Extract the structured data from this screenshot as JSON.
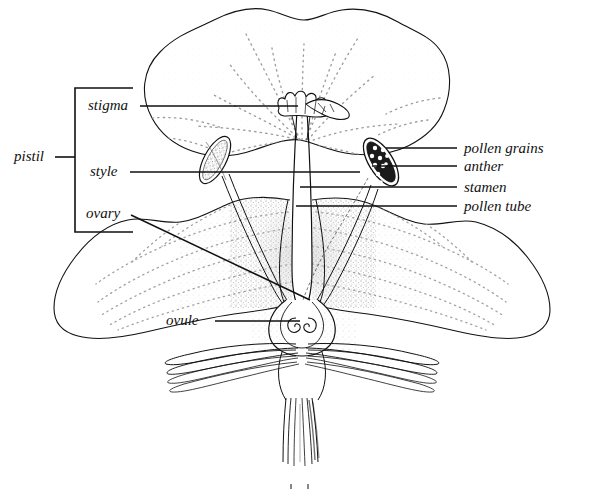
{
  "diagram": {
    "background_color": "#ffffff",
    "ink_color": "#111111",
    "stipple_color": "#9a9a9a",
    "width": 608,
    "height": 493
  },
  "group_labels": {
    "pistil": "pistil"
  },
  "left_labels": [
    {
      "key": "stigma",
      "text": "stigma"
    },
    {
      "key": "style",
      "text": "style"
    },
    {
      "key": "ovary",
      "text": "ovary"
    },
    {
      "key": "ovule",
      "text": "ovule"
    }
  ],
  "right_labels": [
    {
      "key": "pollen_grains",
      "text": "pollen grains"
    },
    {
      "key": "anther",
      "text": "anther"
    },
    {
      "key": "stamen",
      "text": "stamen"
    },
    {
      "key": "pollen_tube",
      "text": "pollen tube"
    }
  ],
  "parts": {
    "petal_upper": "upper-petal",
    "petal_left": "left-petal",
    "petal_right": "right-petal",
    "stigma": "stigma-lobes",
    "style": "style-column",
    "ovary": "ovary-chamber",
    "ovule": "ovule",
    "anther_left": "left-anther",
    "anther_right": "right-anther",
    "filament_left": "left-filament",
    "filament_right": "right-filament",
    "pollen_tube": "pollen-tube",
    "sepals": "sepal-whorl",
    "stem": "flower-stem"
  }
}
